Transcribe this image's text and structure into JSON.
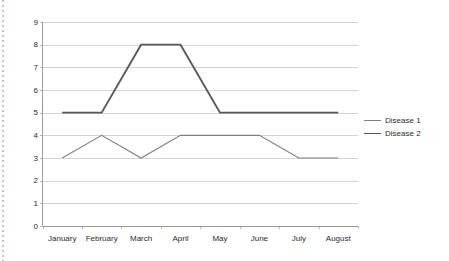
{
  "chart_data": {
    "type": "line",
    "title": "",
    "subtitle": "",
    "xlabel": "",
    "ylabel": "",
    "categories": [
      "January",
      "February",
      "March",
      "April",
      "May",
      "June",
      "July",
      "August"
    ],
    "series": [
      {
        "name": "Disease 1",
        "values": [
          3,
          4,
          3,
          4,
          4,
          4,
          3,
          3
        ],
        "color": "#808080",
        "stroke_width": 1.2
      },
      {
        "name": "Disease 2",
        "values": [
          5,
          5,
          8,
          8,
          5,
          5,
          5,
          5
        ],
        "color": "#595959",
        "stroke_width": 1.9
      }
    ],
    "ylim": [
      0,
      9
    ],
    "yticks": [
      0,
      1,
      2,
      3,
      4,
      5,
      6,
      7,
      8,
      9
    ],
    "ytick_labels": [
      "0",
      "1",
      "2",
      "3",
      "4",
      "5",
      "6",
      "7",
      "8",
      "9"
    ],
    "grid": true,
    "grid_axis": "y",
    "grid_color": "#d4d4d4",
    "legend": true,
    "legend_position": "right",
    "legend_entries": [
      "Disease 1",
      "Disease 2"
    ],
    "background_color": "#ffffff",
    "axis_color": "#9a9a9a",
    "tick_label_color": "#2b2b2b"
  },
  "decor": {
    "left_rule_color": "#c9a5a5"
  }
}
